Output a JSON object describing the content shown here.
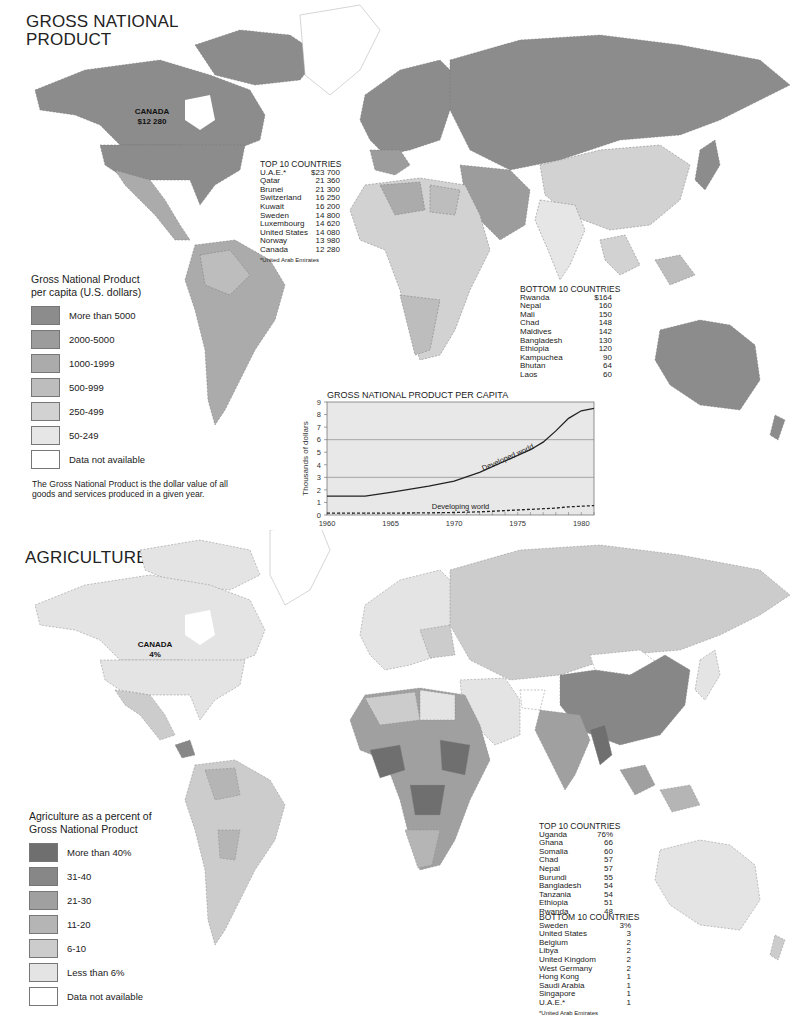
{
  "gnp": {
    "title_line1": "GROSS NATIONAL",
    "title_line2": "PRODUCT",
    "canada_label": {
      "name": "CANADA",
      "value": "$12 280"
    },
    "top10": {
      "title": "TOP 10 COUNTRIES",
      "rows": [
        {
          "country": "U.A.E.*",
          "value": "$23 700"
        },
        {
          "country": "Qatar",
          "value": "21 360"
        },
        {
          "country": "Brunei",
          "value": "21 300"
        },
        {
          "country": "Switzerland",
          "value": "16 250"
        },
        {
          "country": "Kuwait",
          "value": "16 200"
        },
        {
          "country": "Sweden",
          "value": "14 800"
        },
        {
          "country": "Luxembourg",
          "value": "14 620"
        },
        {
          "country": "United States",
          "value": "14 080"
        },
        {
          "country": "Norway",
          "value": "13 980"
        },
        {
          "country": "Canada",
          "value": "12 280"
        }
      ],
      "footnote": "*United Arab Emirates"
    },
    "bottom10": {
      "title": "BOTTOM 10 COUNTRIES",
      "rows": [
        {
          "country": "Rwanda",
          "value": "$164"
        },
        {
          "country": "Nepal",
          "value": "160"
        },
        {
          "country": "Mali",
          "value": "150"
        },
        {
          "country": "Chad",
          "value": "148"
        },
        {
          "country": "Maldives",
          "value": "142"
        },
        {
          "country": "Bangladesh",
          "value": "130"
        },
        {
          "country": "Ethiopia",
          "value": "120"
        },
        {
          "country": "Kampuchea",
          "value": "90"
        },
        {
          "country": "Bhutan",
          "value": "64"
        },
        {
          "country": "Laos",
          "value": "60"
        }
      ]
    },
    "legend": {
      "title_line1": "Gross National Product",
      "title_line2": "per capita (U.S. dollars)",
      "items": [
        {
          "label": "More than 5000",
          "color": "#8c8c8c"
        },
        {
          "label": "2000-5000",
          "color": "#9c9c9c"
        },
        {
          "label": "1000-1999",
          "color": "#ababab"
        },
        {
          "label": "500-999",
          "color": "#bdbdbd"
        },
        {
          "label": "250-499",
          "color": "#d2d2d2"
        },
        {
          "label": "50-249",
          "color": "#e6e6e6"
        },
        {
          "label": "Data not available",
          "color": "#ffffff"
        }
      ]
    },
    "note_line1": "The Gross National Product is the dollar value of all",
    "note_line2": "goods and services produced in a given year."
  },
  "agriculture": {
    "title": "AGRICULTURE",
    "canada_label": {
      "name": "CANADA",
      "value": "4%"
    },
    "top10": {
      "title": "TOP 10 COUNTRIES",
      "rows": [
        {
          "country": "Uganda",
          "value": "76%"
        },
        {
          "country": "Ghana",
          "value": "66"
        },
        {
          "country": "Somalia",
          "value": "60"
        },
        {
          "country": "Chad",
          "value": "57"
        },
        {
          "country": "Nepal",
          "value": "57"
        },
        {
          "country": "Burundi",
          "value": "55"
        },
        {
          "country": "Bangladesh",
          "value": "54"
        },
        {
          "country": "Tanzania",
          "value": "54"
        },
        {
          "country": "Ethiopia",
          "value": "51"
        },
        {
          "country": "Rwanda",
          "value": "48"
        }
      ]
    },
    "bottom10": {
      "title": "BOTTOM 10 COUNTRIES",
      "rows": [
        {
          "country": "Sweden",
          "value": "3%"
        },
        {
          "country": "United States",
          "value": "3"
        },
        {
          "country": "Belgium",
          "value": "2"
        },
        {
          "country": "Libya",
          "value": "2"
        },
        {
          "country": "United Kingdom",
          "value": "2"
        },
        {
          "country": "West Germany",
          "value": "2"
        },
        {
          "country": "Hong Kong",
          "value": "1"
        },
        {
          "country": "Saudi Arabia",
          "value": "1"
        },
        {
          "country": "Singapore",
          "value": "1"
        },
        {
          "country": "U.A.E.*",
          "value": "1"
        }
      ],
      "footnote": "*United Arab Emirates"
    },
    "legend": {
      "title_line1": "Agriculture as a percent of",
      "title_line2": "Gross National Product",
      "items": [
        {
          "label": "More than 40%",
          "color": "#6f6f6f"
        },
        {
          "label": "31-40",
          "color": "#878787"
        },
        {
          "label": "21-30",
          "color": "#a0a0a0"
        },
        {
          "label": "11-20",
          "color": "#b5b5b5"
        },
        {
          "label": "6-10",
          "color": "#cccccc"
        },
        {
          "label": "Less than 6%",
          "color": "#e4e4e4"
        },
        {
          "label": "Data not available",
          "color": "#ffffff"
        }
      ]
    }
  },
  "chart_data": {
    "type": "line",
    "title": "GROSS NATIONAL PRODUCT PER CAPITA",
    "xlabel": "",
    "ylabel": "Thousands of dollars",
    "x": [
      1960,
      1962,
      1963,
      1965,
      1968,
      1970,
      1972,
      1974,
      1976,
      1977,
      1978,
      1979,
      1980,
      1981
    ],
    "series": [
      {
        "name": "Developed world",
        "style": "solid",
        "values": [
          1.5,
          1.5,
          1.5,
          1.8,
          2.3,
          2.7,
          3.4,
          4.3,
          5.2,
          5.8,
          6.7,
          7.7,
          8.3,
          8.5
        ]
      },
      {
        "name": "Developing world",
        "style": "dashed",
        "values": [
          0.15,
          0.15,
          0.15,
          0.15,
          0.17,
          0.2,
          0.25,
          0.35,
          0.45,
          0.5,
          0.55,
          0.65,
          0.7,
          0.75
        ]
      }
    ],
    "x_ticks": [
      1960,
      1965,
      1970,
      1975,
      1980
    ],
    "y_ticks": [
      0,
      1,
      2,
      3,
      4,
      5,
      6,
      7,
      8,
      9
    ],
    "xlim": [
      1960,
      1981
    ],
    "ylim": [
      0,
      9
    ],
    "gridlines_y": [
      3,
      6
    ],
    "background": "#e8e8e8"
  }
}
